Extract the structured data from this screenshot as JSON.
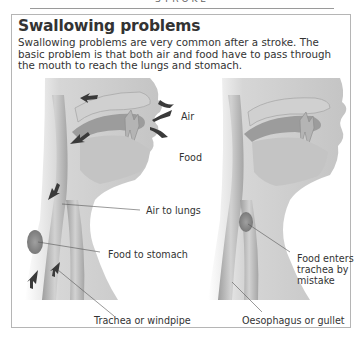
{
  "running_head": "STROKE",
  "section": {
    "title": "Swallowing problems",
    "intro": "Swallowing problems are very common after a stroke. The basic problem is that both air and food have to pass through the mouth to reach the lungs and stomach."
  },
  "figure_left": {
    "labels": {
      "air": "Air",
      "food": "Food",
      "air_to_lungs": "Air to lungs",
      "food_to_stomach": "Food to stomach",
      "trachea": "Trachea or windpipe"
    }
  },
  "figure_right": {
    "labels": {
      "food_enters_1": "Food enters",
      "food_enters_2": "trachea by",
      "food_enters_3": "mistake",
      "oesophagus": "Oesophagus or gullet"
    }
  },
  "colors": {
    "tissue": "#bdbdbd",
    "tissue_dark": "#8f8f8f",
    "arrow": "#3a3a3a",
    "frame": "#b5b5b5"
  }
}
